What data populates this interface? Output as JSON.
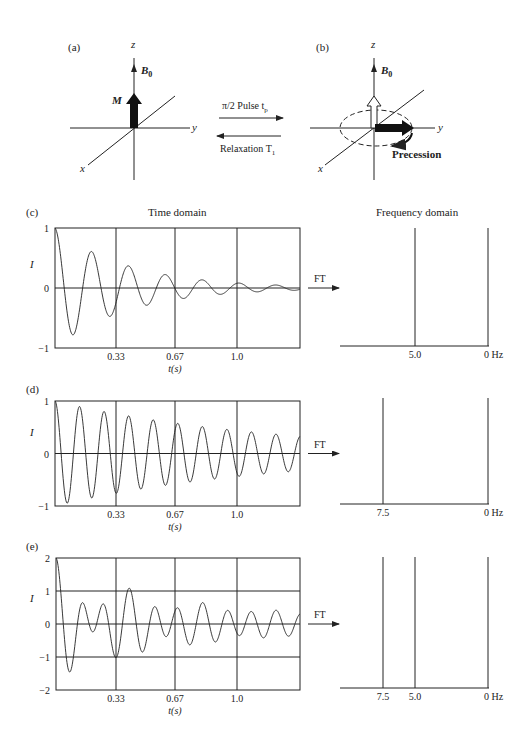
{
  "panels": {
    "a": {
      "label": "(a)",
      "axes": {
        "z": "z",
        "y": "y",
        "x": "x"
      },
      "field_label": "B",
      "field_sub": "0",
      "magnetization_label": "M"
    },
    "transition": {
      "forward_label": "π/2 Pulse t",
      "forward_sub": "p",
      "backward_label": "Relaxation T",
      "backward_sub": "1"
    },
    "b": {
      "label": "(b)",
      "axes": {
        "z": "z",
        "y": "y",
        "x": "x"
      },
      "field_label": "B",
      "field_sub": "0",
      "precession_label": "Precession"
    },
    "c": {
      "label": "(c)",
      "time_title": "Time domain",
      "freq_title": "Frequency domain",
      "ylabel": "I",
      "yticks": [
        "1",
        "0",
        "−1"
      ],
      "xticks": [
        "0.33",
        "0.67",
        "1.0"
      ],
      "xlabel": "t(s)",
      "ft_label": "FT",
      "freq_ticks": [
        "5.0",
        "0 Hz"
      ]
    },
    "d": {
      "label": "(d)",
      "ylabel": "I",
      "yticks": [
        "1",
        "0",
        "−1"
      ],
      "xticks": [
        "0.33",
        "0.67",
        "1.0"
      ],
      "xlabel": "t(s)",
      "ft_label": "FT",
      "freq_ticks": [
        "7.5",
        "0 Hz"
      ]
    },
    "e": {
      "label": "(e)",
      "ylabel": "I",
      "yticks": [
        "2",
        "1",
        "0",
        "−1",
        "−2"
      ],
      "xticks": [
        "0.33",
        "0.67",
        "1.0"
      ],
      "xlabel": "t(s)",
      "ft_label": "FT",
      "freq_ticks": [
        "7.5",
        "5.0",
        "0 Hz"
      ]
    }
  },
  "chart_data": [
    {
      "type": "line",
      "title": "(c) Time domain",
      "xlabel": "t(s)",
      "ylabel": "I",
      "xlim": [
        0,
        1.33
      ],
      "ylim": [
        -1,
        1
      ],
      "series": [
        {
          "name": "FID 5 Hz",
          "frequency_hz": 5.0,
          "amplitude": 1.0,
          "decay_T2_s": 0.4
        }
      ],
      "xticks": [
        0.33,
        0.67,
        1.0
      ]
    },
    {
      "type": "bar",
      "title": "(c) Frequency domain",
      "categories": [
        "5.0",
        "0 Hz"
      ],
      "values": [
        1,
        1
      ],
      "note": "spectral line at 5.0 Hz; axis reference at 0 Hz"
    },
    {
      "type": "line",
      "title": "(d) Time domain",
      "xlabel": "t(s)",
      "ylabel": "I",
      "xlim": [
        0,
        1.33
      ],
      "ylim": [
        -1,
        1
      ],
      "series": [
        {
          "name": "FID 7.5 Hz",
          "frequency_hz": 7.5,
          "amplitude": 1.0,
          "decay_T2_s": 1.2
        }
      ],
      "xticks": [
        0.33,
        0.67,
        1.0
      ]
    },
    {
      "type": "bar",
      "title": "(d) Frequency domain",
      "categories": [
        "7.5",
        "0 Hz"
      ],
      "values": [
        1,
        1
      ],
      "note": "spectral line at 7.5 Hz; axis reference at 0 Hz"
    },
    {
      "type": "line",
      "title": "(e) Time domain",
      "xlabel": "t(s)",
      "ylabel": "I",
      "xlim": [
        0,
        1.33
      ],
      "ylim": [
        -2,
        2
      ],
      "series": [
        {
          "name": "FID 5 Hz + 7.5 Hz",
          "components": [
            {
              "frequency_hz": 5.0,
              "amplitude": 1.0,
              "decay_T2_s": 0.4
            },
            {
              "frequency_hz": 7.5,
              "amplitude": 1.0,
              "decay_T2_s": 1.2
            }
          ]
        }
      ],
      "xticks": [
        0.33,
        0.67,
        1.0
      ]
    },
    {
      "type": "bar",
      "title": "(e) Frequency domain",
      "categories": [
        "7.5",
        "5.0",
        "0 Hz"
      ],
      "values": [
        1,
        1,
        1
      ],
      "note": "spectral lines at 7.5 and 5.0 Hz; axis reference at 0 Hz"
    }
  ]
}
